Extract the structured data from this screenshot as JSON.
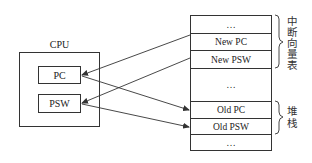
{
  "cpu": {
    "title": "CPU",
    "registers": [
      {
        "label": "PC"
      },
      {
        "label": "PSW"
      }
    ]
  },
  "memory": {
    "cells": [
      {
        "label": "…"
      },
      {
        "label": "New PC"
      },
      {
        "label": "New PSW"
      },
      {
        "label": "…"
      },
      {
        "label": "Old PC"
      },
      {
        "label": "Old PSW"
      },
      {
        "label": "…"
      }
    ],
    "brackets": [
      {
        "label": "中断向量表",
        "chars": [
          "中",
          "断",
          "向",
          "量",
          "表"
        ]
      },
      {
        "label": "堆栈",
        "chars": [
          "堆",
          "栈"
        ]
      }
    ]
  },
  "arrows": [
    {
      "from": "New PC",
      "to": "PC"
    },
    {
      "from": "New PSW",
      "to": "PSW"
    },
    {
      "from": "PC",
      "to": "Old PC"
    },
    {
      "from": "PSW",
      "to": "Old PSW"
    }
  ],
  "colors": {
    "line": "#333333",
    "background": "#ffffff"
  }
}
